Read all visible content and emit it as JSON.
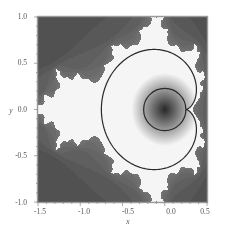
{
  "chart_data": {
    "type": "heatmap",
    "title": "",
    "subtitle": "",
    "xlabel": "x",
    "ylabel": "y",
    "xlim": [
      -1.5,
      0.5
    ],
    "ylim": [
      -1.0,
      1.0
    ],
    "x_ticks": [
      -1.5,
      -1.0,
      -0.5,
      0.0,
      0.5
    ],
    "x_tick_labels": [
      "-1.5",
      "-1.0",
      "-0.5",
      "0.0",
      "0.5"
    ],
    "y_ticks": [
      -1.0,
      -0.5,
      0.0,
      0.5,
      1.0
    ],
    "y_tick_labels": [
      "-1.0",
      "-0.5",
      "0.0",
      "0.5",
      "1.0"
    ],
    "grid": false,
    "legend": null,
    "colormap": "grayscale (dark outside, white near set boundary, radial gray gradient inside curves)",
    "overlays": [
      {
        "name": "outer-cardioid-curve",
        "shape": "cardioid",
        "param": "c = e^{it}/2 - e^{2it}/4",
        "cusp": [
          0.25,
          0.0
        ],
        "leftmost_x": -0.75,
        "color": "#333333"
      },
      {
        "name": "inner-circle-curve",
        "shape": "circle",
        "center": [
          0.0,
          0.0
        ],
        "radius": 0.25,
        "color": "#333333"
      }
    ],
    "colors": {
      "frame": "#888888",
      "curve": "#2a2a2a",
      "background": "#ffffff",
      "exterior_dark": "#2b2b2b",
      "boundary_white": "#f5f5f5"
    }
  },
  "axes": {
    "x_label": "x",
    "y_label": "y",
    "x_tick_labels": [
      "-1.5",
      "-1.0",
      "-0.5",
      "0.0",
      "0.5"
    ],
    "y_tick_labels": [
      "1.0",
      "0.5",
      "0.0",
      "-0.5",
      "-1.0"
    ]
  }
}
